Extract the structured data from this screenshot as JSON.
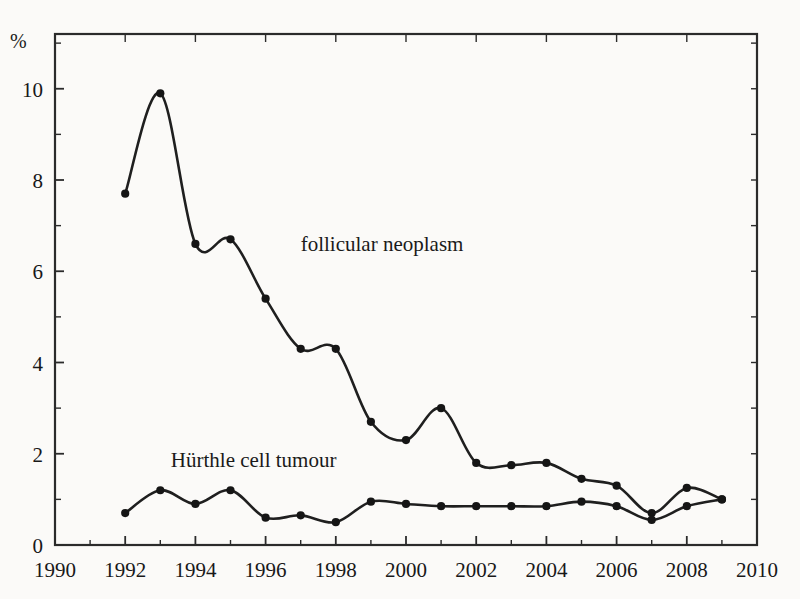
{
  "chart_data": {
    "type": "line",
    "title": "",
    "xlabel": "",
    "ylabel": "%",
    "xlim": [
      1990,
      2010
    ],
    "ylim": [
      0,
      11.2
    ],
    "xticks": [
      1990,
      1992,
      1994,
      1996,
      1998,
      2000,
      2002,
      2004,
      2006,
      2008,
      2010
    ],
    "xtick_labels": [
      "1990",
      "1992",
      "1994",
      "1996",
      "1998",
      "2000",
      "2002",
      "2004",
      "2006",
      "2008",
      "2010"
    ],
    "yticks": [
      0,
      2,
      4,
      6,
      8,
      10
    ],
    "ytick_labels": [
      "0",
      "2",
      "4",
      "6",
      "8",
      "10"
    ],
    "y_minor_ticks": [
      1,
      3,
      5,
      7,
      9,
      11
    ],
    "x_minor_ticks": [
      1991,
      1993,
      1995,
      1997,
      1999,
      2001,
      2003,
      2005,
      2007,
      2009
    ],
    "grid": false,
    "legend": "inline-annotations",
    "x": [
      1992,
      1993,
      1994,
      1995,
      1996,
      1997,
      1998,
      1999,
      2000,
      2001,
      2002,
      2003,
      2004,
      2005,
      2006,
      2007,
      2008,
      2009
    ],
    "series": [
      {
        "name": "follicular neoplasm",
        "color": "#1f1f1f",
        "marker": "filled-circle",
        "label_x": 1997.0,
        "label_y": 6.45,
        "values": [
          7.7,
          9.9,
          6.6,
          6.7,
          5.4,
          4.3,
          4.3,
          2.7,
          2.3,
          3.0,
          1.8,
          1.75,
          1.8,
          1.45,
          1.3,
          0.7,
          1.25,
          1.0
        ]
      },
      {
        "name": "Hürthle cell tumour",
        "color": "#1f1f1f",
        "marker": "filled-circle",
        "label_x": 1993.3,
        "label_y": 1.72,
        "values": [
          0.7,
          1.2,
          0.9,
          1.2,
          0.6,
          0.65,
          0.5,
          0.95,
          0.9,
          0.85,
          0.85,
          0.85,
          0.85,
          0.95,
          0.85,
          0.55,
          0.85,
          1.0
        ]
      }
    ]
  }
}
